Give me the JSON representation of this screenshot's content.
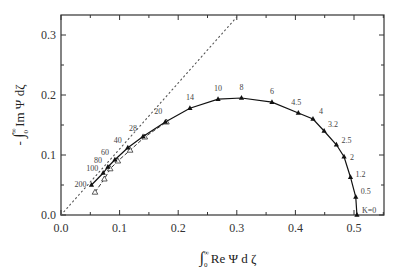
{
  "chart_data": {
    "type": "line",
    "title": "",
    "xlabel": "∫₀^∞ Re Ψ dζ",
    "ylabel": "-∫₀^∞ Im Ψ dζ",
    "xlim": [
      0.0,
      0.55
    ],
    "ylim": [
      0.0,
      0.33
    ],
    "xticks": [
      "0.0",
      "0.1",
      "0.2",
      "0.3",
      "0.4",
      "0.5"
    ],
    "yticks": [
      "0.0",
      "0.1",
      "0.2",
      "0.3"
    ],
    "grid": false,
    "legend": null,
    "series": [
      {
        "name": "solid curve (K values)",
        "style": "solid line with filled triangle markers",
        "points": [
          {
            "label": "K=0",
            "x": 0.505,
            "y": 0.0
          },
          {
            "label": "0.5",
            "x": 0.503,
            "y": 0.03
          },
          {
            "label": "1.2",
            "x": 0.494,
            "y": 0.063
          },
          {
            "label": "2",
            "x": 0.483,
            "y": 0.097
          },
          {
            "label": "2.5",
            "x": 0.47,
            "y": 0.117
          },
          {
            "label": "3.2",
            "x": 0.449,
            "y": 0.14
          },
          {
            "label": "4",
            "x": 0.43,
            "y": 0.16
          },
          {
            "label": "4.5",
            "x": 0.405,
            "y": 0.17
          },
          {
            "label": "6",
            "x": 0.36,
            "y": 0.188
          },
          {
            "label": "8",
            "x": 0.308,
            "y": 0.195
          },
          {
            "label": "10",
            "x": 0.268,
            "y": 0.193
          },
          {
            "label": "14",
            "x": 0.22,
            "y": 0.178
          },
          {
            "label": "20",
            "x": 0.178,
            "y": 0.155
          },
          {
            "label": "28",
            "x": 0.14,
            "y": 0.131
          },
          {
            "label": "40",
            "x": 0.114,
            "y": 0.112
          },
          {
            "label": "60",
            "x": 0.092,
            "y": 0.092
          },
          {
            "label": "80",
            "x": 0.08,
            "y": 0.08
          },
          {
            "label": "100",
            "x": 0.072,
            "y": 0.07
          },
          {
            "label": "200",
            "x": 0.052,
            "y": 0.05
          }
        ]
      },
      {
        "name": "dashed curve",
        "style": "dashed line with open triangle markers",
        "points": [
          {
            "x": 0.058,
            "y": 0.038
          },
          {
            "x": 0.074,
            "y": 0.06
          },
          {
            "x": 0.084,
            "y": 0.077
          },
          {
            "x": 0.097,
            "y": 0.09
          },
          {
            "x": 0.118,
            "y": 0.108
          },
          {
            "x": 0.143,
            "y": 0.13
          },
          {
            "x": 0.18,
            "y": 0.155
          }
        ]
      },
      {
        "name": "dotted reference line",
        "style": "dotted",
        "points": [
          {
            "x": 0.0,
            "y": 0.0
          },
          {
            "x": 0.3,
            "y": 0.33
          }
        ]
      }
    ]
  }
}
